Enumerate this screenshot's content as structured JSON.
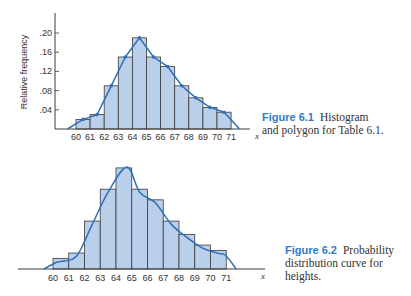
{
  "figures": [
    {
      "id": "6.1",
      "caption_label": "Figure 6.1",
      "caption_line1": "Histogram",
      "caption_line2": "and polygon for Table 6.1."
    },
    {
      "id": "6.2",
      "caption_label": "Figure 6.2",
      "caption_line1": "Probability",
      "caption_line2": "distribution curve for",
      "caption_line3": "heights."
    }
  ],
  "colors": {
    "bar_fill": "#b9cfea",
    "bar_stroke": "#3a3a3a",
    "curve": "#2f6fb8",
    "caption_label": "#2f7bc4"
  },
  "chart_data": [
    {
      "type": "bar",
      "title": "Figure 6.1 Histogram and polygon for Table 6.1.",
      "xlabel": "x",
      "ylabel": "Relative frequency",
      "x_tick_labels": [
        "60",
        "61",
        "62",
        "63",
        "64",
        "65",
        "66",
        "67",
        "68",
        "69",
        "70",
        "71"
      ],
      "y_tick_labels": [
        ".04",
        ".08",
        ".12",
        ".16",
        ".20"
      ],
      "ylim": [
        0,
        0.22
      ],
      "bins": [
        [
          60,
          61
        ],
        [
          61,
          62
        ],
        [
          62,
          63
        ],
        [
          63,
          64
        ],
        [
          64,
          65
        ],
        [
          65,
          66
        ],
        [
          66,
          67
        ],
        [
          67,
          68
        ],
        [
          68,
          69
        ],
        [
          69,
          70
        ],
        [
          70,
          71
        ]
      ],
      "values": [
        0.02,
        0.03,
        0.09,
        0.15,
        0.19,
        0.15,
        0.13,
        0.09,
        0.065,
        0.045,
        0.035
      ],
      "overlay": "frequency polygon through bin midpoints",
      "grid": false
    },
    {
      "type": "bar",
      "title": "Figure 6.2 Probability distribution curve for heights.",
      "xlabel": "x",
      "ylabel": "",
      "x_tick_labels": [
        "60",
        "61",
        "62",
        "63",
        "64",
        "65",
        "66",
        "67",
        "68",
        "69",
        "70",
        "71"
      ],
      "bins": [
        [
          60,
          61
        ],
        [
          61,
          62
        ],
        [
          62,
          63
        ],
        [
          63,
          64
        ],
        [
          64,
          65
        ],
        [
          65,
          66
        ],
        [
          66,
          67
        ],
        [
          67,
          68
        ],
        [
          68,
          69
        ],
        [
          69,
          70
        ],
        [
          70,
          71
        ]
      ],
      "values": [
        0.02,
        0.03,
        0.09,
        0.15,
        0.19,
        0.15,
        0.13,
        0.09,
        0.065,
        0.045,
        0.035
      ],
      "overlay": "smooth probability density curve",
      "grid": false
    }
  ]
}
